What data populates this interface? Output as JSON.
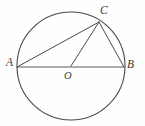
{
  "figure": {
    "kind": "circle-geometry-diagram",
    "background_color": "#fefefe",
    "stroke_color": "#4a4a4a",
    "label_color": "#3b3b3b",
    "width": 145,
    "height": 126,
    "circle": {
      "name": "circumscribed-circle",
      "cx": 71,
      "cy": 66,
      "r": 54,
      "stroke_width": 1.1
    },
    "points": [
      {
        "id": "A",
        "label": "A",
        "x": 17,
        "y": 67,
        "on": "circle"
      },
      {
        "id": "B",
        "label": "B",
        "x": 124,
        "y": 67,
        "on": "circle"
      },
      {
        "id": "C",
        "label": "C",
        "x": 99,
        "y": 22,
        "on": "circle"
      },
      {
        "id": "O",
        "label": "O",
        "x": 71,
        "y": 66,
        "on": "center"
      }
    ],
    "segments": [
      {
        "id": "AB",
        "label": "AB",
        "from": "A",
        "to": "B",
        "x1": 17,
        "y1": 67,
        "x2": 124,
        "y2": 67,
        "role": "diameter",
        "stroke_width": 1.2
      },
      {
        "id": "AC",
        "label": "AC",
        "from": "A",
        "to": "C",
        "x1": 17,
        "y1": 67,
        "x2": 99,
        "y2": 22,
        "role": "chord",
        "stroke_width": 1.0
      },
      {
        "id": "BC",
        "label": "BC",
        "from": "B",
        "to": "C",
        "x1": 124,
        "y1": 67,
        "x2": 99,
        "y2": 22,
        "role": "chord",
        "stroke_width": 1.0
      },
      {
        "id": "OC",
        "label": "OC",
        "from": "O",
        "to": "C",
        "x1": 71,
        "y1": 66,
        "x2": 99,
        "y2": 22,
        "role": "radius",
        "stroke_width": 1.0
      }
    ],
    "labels": {
      "A": "A",
      "B": "B",
      "C": "C",
      "O": "O"
    }
  }
}
